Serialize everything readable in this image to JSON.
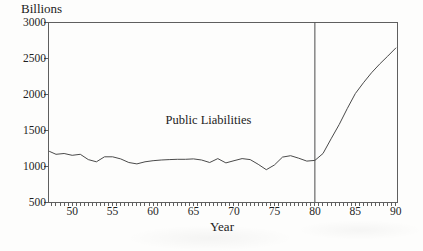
{
  "chart_data": {
    "type": "line",
    "title": "",
    "y_axis_title": "Billions",
    "x_axis_title": "Year",
    "annotation": "Public Liabilities",
    "x_tick_labels": [
      "50",
      "55",
      "60",
      "65",
      "70",
      "75",
      "80",
      "85",
      "90"
    ],
    "y_tick_labels": [
      "500",
      "1000",
      "1500",
      "2000",
      "2500",
      "3000"
    ],
    "xlim": [
      47.1,
      90.15
    ],
    "ylim": [
      500,
      3000
    ],
    "x_minor_tick_step": 0.5,
    "grid": false,
    "legend_position": "none",
    "reference_line_x": 80,
    "series": [
      {
        "name": "Public Liabilities",
        "x": [
          47.2,
          48,
          49,
          50,
          51,
          52,
          53,
          54,
          55,
          56,
          57,
          58,
          59,
          60,
          61,
          62,
          63,
          64,
          65,
          66,
          67,
          68,
          69,
          70,
          71,
          72,
          73,
          74,
          75,
          76,
          77,
          78,
          79,
          80,
          81,
          82,
          83,
          84,
          85,
          86,
          87,
          88,
          89,
          90
        ],
        "y": [
          1205,
          1165,
          1175,
          1150,
          1165,
          1090,
          1060,
          1130,
          1130,
          1100,
          1050,
          1030,
          1060,
          1075,
          1085,
          1090,
          1095,
          1095,
          1100,
          1085,
          1050,
          1105,
          1045,
          1075,
          1105,
          1090,
          1025,
          950,
          1015,
          1125,
          1145,
          1110,
          1070,
          1080,
          1175,
          1380,
          1580,
          1800,
          2010,
          2160,
          2300,
          2420,
          2530,
          2645
        ]
      }
    ],
    "colors": {
      "line": "#4a4a4a",
      "axis": "#5f5f5f",
      "reference_line": "#4a4a4a",
      "text": "#222222",
      "background": "#fdfdfc"
    }
  }
}
